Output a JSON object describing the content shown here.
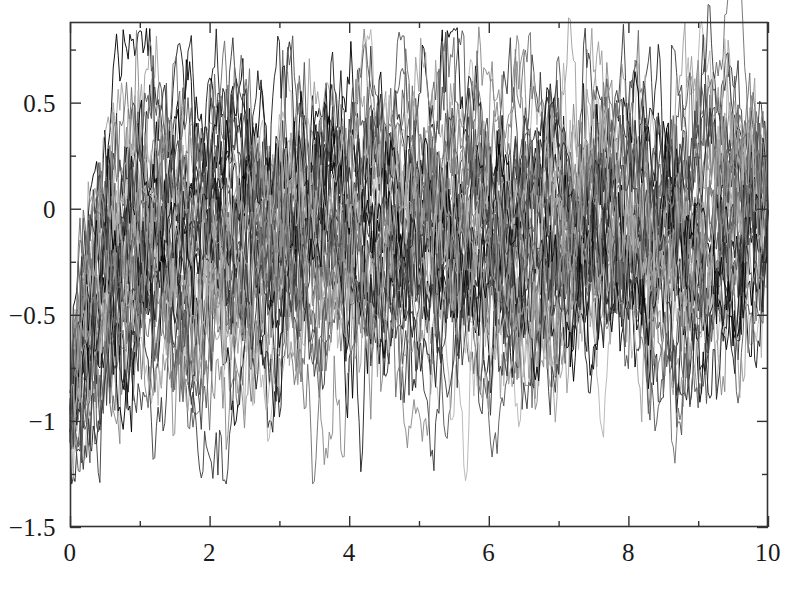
{
  "chart_data": {
    "type": "line",
    "title": "",
    "subtitle": "",
    "xlabel": "",
    "ylabel": "",
    "xlim": [
      0,
      10
    ],
    "ylim": [
      -1.5,
      0.88
    ],
    "grid": false,
    "legend": null,
    "background": "#ffffff",
    "axis_color": "#333333",
    "x_major_ticks": [
      0,
      2,
      4,
      6,
      8,
      10
    ],
    "x_major_tick_labels": [
      "0",
      "2",
      "4",
      "6",
      "8",
      "10"
    ],
    "x_minor_ticks": [
      1,
      3,
      5,
      7,
      9
    ],
    "y_major_ticks": [
      0.5,
      0,
      -0.5,
      -1,
      -1.5
    ],
    "y_major_tick_labels": [
      "0.5",
      "0",
      "−0.5",
      "−1",
      "−1.5"
    ],
    "y_minor_ticks": [
      0.75,
      0.25,
      -0.25,
      -0.75,
      -1.25
    ],
    "n_series": 40,
    "n_points_per_series": 420,
    "series_colors": [
      "#000000",
      "#1e1e1e",
      "#3a3a3a",
      "#555555",
      "#6e6e6e",
      "#888888",
      "#9e9e9e",
      "#b4b4b4"
    ],
    "line_width": 1,
    "start_value": -1.0,
    "end_value": 0.0,
    "mean_asymptote": -0.1,
    "noise_sigma": 0.27,
    "mean_reversion_rate": 2.6,
    "envelope_upper_peak": 0.78,
    "envelope_lower_min": -1.28,
    "envelope_samples": {
      "x": [
        0,
        0.5,
        1,
        1.5,
        2,
        2.5,
        3,
        3.5,
        4,
        4.5,
        5,
        5.5,
        6,
        6.5,
        7,
        7.5,
        8,
        8.5,
        9,
        9.5,
        10
      ],
      "upper": [
        -0.9,
        -0.18,
        0.14,
        0.42,
        0.48,
        0.78,
        0.52,
        0.54,
        0.58,
        0.66,
        0.62,
        0.7,
        0.6,
        0.6,
        0.62,
        0.6,
        0.72,
        0.58,
        0.56,
        0.5,
        0.18
      ],
      "lower": [
        -1.12,
        -1.26,
        -1.1,
        -0.88,
        -0.74,
        -0.68,
        -0.66,
        -0.6,
        -0.62,
        -0.64,
        -0.7,
        -0.64,
        -0.6,
        -0.62,
        -0.62,
        -0.62,
        -0.6,
        -0.58,
        -0.56,
        -0.5,
        -0.16
      ]
    }
  },
  "axes": {
    "plot_box_px": {
      "left": 70,
      "top": 22,
      "right": 768,
      "bottom": 527
    }
  }
}
